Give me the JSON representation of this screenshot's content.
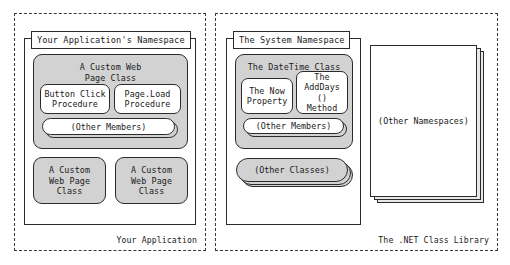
{
  "diagram": {
    "panels": {
      "application": {
        "footer": "Your Application",
        "namespace_title": "Your Application's Namespace",
        "groups": [
          {
            "name": "custom-web-page-class",
            "title": "A Custom Web\nPage Class",
            "members": [
              {
                "name": "button-click-procedure",
                "label": "Button Click\nProcedure"
              },
              {
                "name": "page-load-procedure",
                "label": "Page.Load\nProcedure"
              }
            ],
            "pill": "(Other Members)"
          }
        ],
        "sibling_classes": [
          {
            "name": "custom-web-page-class-2",
            "label": "A Custom\nWeb Page\nClass"
          },
          {
            "name": "custom-web-page-class-3",
            "label": "A Custom\nWeb Page\nClass"
          }
        ]
      },
      "net_library": {
        "footer": "The .NET Class Library",
        "namespace_title": "The System Namespace",
        "groups": [
          {
            "name": "datetime-class",
            "title": "The DateTime Class",
            "members": [
              {
                "name": "now-property",
                "label": "The Now\nProperty"
              },
              {
                "name": "adddays-method",
                "label": "The\nAddDays ()\nMethod"
              }
            ],
            "pill": "(Other Members)"
          }
        ],
        "other_classes_stack": "(Other Classes)",
        "other_namespaces_stack": "(Other Namespaces)"
      }
    },
    "colors": {
      "group_fill": "#d2d2d2",
      "member_fill": "#ffffff",
      "stroke": "#2b2b2b",
      "dashed_stroke": "#3a3a3a",
      "sheet_shadow": "#e8e8e8",
      "background": "#ffffff"
    }
  }
}
